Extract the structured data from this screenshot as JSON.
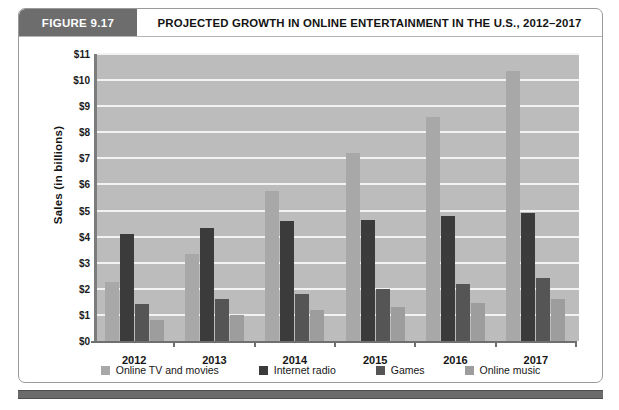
{
  "header": {
    "figure_number": "FIGURE 9.17",
    "title": "PROJECTED GROWTH IN ONLINE ENTERTAINMENT IN THE U.S., 2012–2017"
  },
  "colors": {
    "badge_bg": "#6d6d6d",
    "plot_bg": "#bcbcbc",
    "gridline": "#f2f2f2",
    "axis": "#6f6f6f",
    "online_tv": "#a8a8a8",
    "internet_radio": "#3b3b3b",
    "games": "#555555",
    "online_music": "#9d9d9d"
  },
  "chart_data": {
    "type": "bar",
    "title": "PROJECTED GROWTH IN ONLINE ENTERTAINMENT IN THE U.S., 2012–2017",
    "xlabel": "",
    "ylabel": "Sales (in billions)",
    "ylim": [
      0,
      11
    ],
    "ytick_step": 1,
    "ytick_labels": [
      "$0",
      "$1",
      "$2",
      "$3",
      "$4",
      "$5",
      "$6",
      "$7",
      "$8",
      "$9",
      "$10",
      "$11"
    ],
    "grid": true,
    "legend_position": "bottom",
    "categories": [
      "2012",
      "2013",
      "2014",
      "2015",
      "2016",
      "2017"
    ],
    "series": [
      {
        "name": "Online TV and movies",
        "color": "#a8a8a8",
        "values": [
          2.25,
          3.35,
          5.75,
          7.2,
          8.6,
          10.35
        ]
      },
      {
        "name": "Internet radio",
        "color": "#3b3b3b",
        "values": [
          4.1,
          4.35,
          4.6,
          4.65,
          4.8,
          4.9
        ]
      },
      {
        "name": "Games",
        "color": "#555555",
        "values": [
          1.4,
          1.6,
          1.8,
          2.0,
          2.2,
          2.4
        ]
      },
      {
        "name": "Online music",
        "color": "#9d9d9d",
        "values": [
          0.8,
          1.0,
          1.2,
          1.3,
          1.45,
          1.6
        ]
      }
    ]
  }
}
